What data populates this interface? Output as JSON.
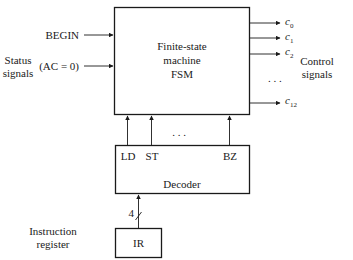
{
  "fsm": {
    "title_line1": "Finite-state",
    "title_line2": "machine",
    "title_line3": "FSM"
  },
  "inputs": {
    "begin": "BEGIN",
    "ac_zero": "(AC = 0)",
    "status_line1": "Status",
    "status_line2": "signals"
  },
  "outputs": {
    "c0_base": "c",
    "c0_sub": "0",
    "c1_base": "c",
    "c1_sub": "1",
    "c2_base": "c",
    "c2_sub": "2",
    "c12_base": "c",
    "c12_sub": "12",
    "ellipsis": ". . .",
    "control_line1": "Control",
    "control_line2": "signals"
  },
  "decoder": {
    "title": "Decoder",
    "out_ld": "LD",
    "out_st": "ST",
    "out_bz": "BZ",
    "ellipsis": ". . ."
  },
  "ir": {
    "label": "IR",
    "bus_width": "4",
    "caption_line1": "Instruction",
    "caption_line2": "register"
  }
}
